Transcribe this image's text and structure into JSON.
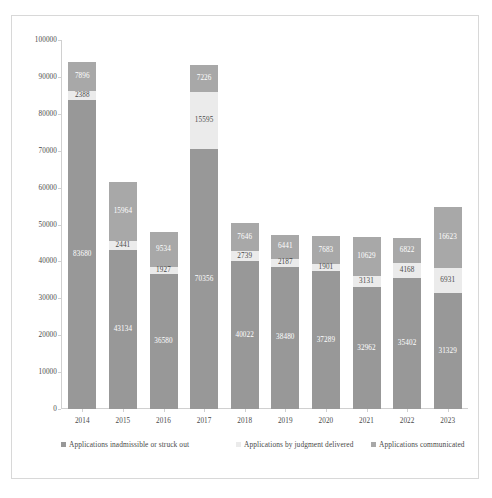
{
  "chart_data": {
    "type": "bar",
    "subtype": "stacked-column",
    "title": "",
    "xlabel": "",
    "ylabel": "",
    "ylim": [
      0,
      100000
    ],
    "ytick_step": 10000,
    "yticks": [
      "100000",
      "90000",
      "80000",
      "70000",
      "60000",
      "50000",
      "40000",
      "30000",
      "20000",
      "10000",
      "0"
    ],
    "grid": false,
    "legend_position": "bottom",
    "categories": [
      "2014",
      "2015",
      "2016",
      "2017",
      "2018",
      "2019",
      "2020",
      "2021",
      "2022",
      "2023"
    ],
    "series": [
      {
        "name": "Applications inadmissible or struck out",
        "color": "#989898",
        "values": [
          83680,
          43134,
          36580,
          70356,
          40022,
          38480,
          37289,
          32962,
          35402,
          31329
        ]
      },
      {
        "name": "Applications by judgment delivered",
        "color": "#ebebeb",
        "values": [
          2388,
          2441,
          1927,
          15595,
          2739,
          2187,
          1901,
          3131,
          4168,
          6931
        ]
      },
      {
        "name": "Applications communicated",
        "color": "#a8a8a8",
        "values": [
          7896,
          15964,
          9534,
          7226,
          7646,
          6441,
          7683,
          10629,
          6822,
          16623
        ]
      }
    ],
    "totals": [
      93964,
      61539,
      48041,
      93177,
      50407,
      47108,
      46873,
      46722,
      46392,
      54883
    ]
  },
  "legend": {
    "items": [
      {
        "label": "Applications inadmissible or struck out",
        "color": "#989898",
        "marker": "square-icon"
      },
      {
        "label": "Applications by judgment delivered",
        "color": "#ebebeb",
        "marker": "square-icon"
      },
      {
        "label": "Applications communicated",
        "color": "#a8a8a8",
        "marker": "square-icon"
      }
    ]
  },
  "colors": {
    "frame_border": "#d8d8d8",
    "axis_line": "#d0d0d0",
    "text": "#4a4a4a",
    "background": "#ffffff"
  }
}
